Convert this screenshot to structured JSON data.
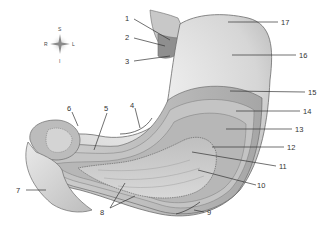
{
  "diagram": {
    "compass": {
      "top": "S",
      "bottom": "I",
      "left": "R",
      "right": "L"
    },
    "labels": [
      {
        "id": "1",
        "text": "1"
      },
      {
        "id": "2",
        "text": "2"
      },
      {
        "id": "3",
        "text": "3"
      },
      {
        "id": "4",
        "text": "4"
      },
      {
        "id": "5",
        "text": "5"
      },
      {
        "id": "6",
        "text": "6"
      },
      {
        "id": "7",
        "text": "7"
      },
      {
        "id": "8",
        "text": "8"
      },
      {
        "id": "9",
        "text": "9"
      },
      {
        "id": "10",
        "text": "10"
      },
      {
        "id": "11",
        "text": "11"
      },
      {
        "id": "12",
        "text": "12"
      },
      {
        "id": "13",
        "text": "13"
      },
      {
        "id": "14",
        "text": "14"
      },
      {
        "id": "15",
        "text": "15"
      },
      {
        "id": "16",
        "text": "16"
      },
      {
        "id": "17",
        "text": "17"
      }
    ],
    "colors": {
      "outline": "#6b6b6b",
      "surface_light": "#e6e6e6",
      "surface_mid": "#c9c9c9",
      "surface_dark": "#9a9a9a",
      "text": "#333333"
    }
  }
}
